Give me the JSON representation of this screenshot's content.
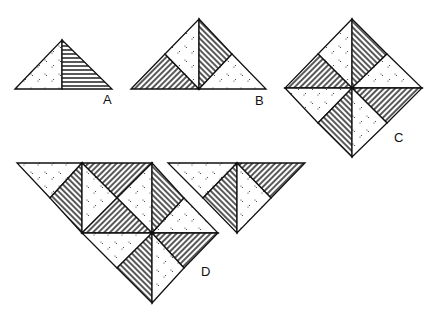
{
  "figure": {
    "labels": [
      {
        "id": "A",
        "text": "A",
        "x": 103,
        "y": 93
      },
      {
        "id": "B",
        "text": "B",
        "x": 255,
        "y": 94
      },
      {
        "id": "C",
        "text": "C",
        "x": 394,
        "y": 131
      },
      {
        "id": "D",
        "text": "D",
        "x": 201,
        "y": 265
      }
    ],
    "fills": {
      "stroke": "#111111",
      "background": "#ffffff",
      "pattern_dots": "dotted",
      "pattern_hstripes": "horizontal-stripes",
      "pattern_diag_up": "diagonal-stripes-forward",
      "pattern_diag_down": "diagonal-stripes-back"
    }
  }
}
